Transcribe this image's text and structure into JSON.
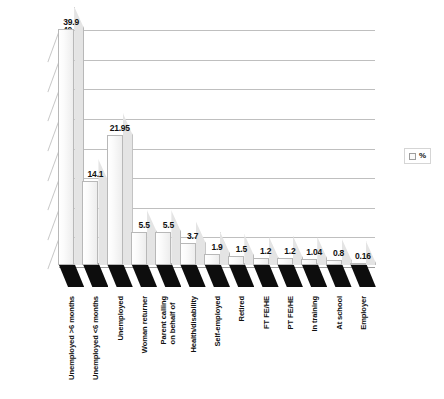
{
  "chart_data": {
    "type": "bar",
    "title": "",
    "subtitle": "",
    "xlabel": "",
    "ylabel": "",
    "ylim": [
      0,
      40
    ],
    "yticks": [
      0,
      5,
      10,
      15,
      20,
      25,
      30,
      35,
      40
    ],
    "grid": true,
    "legend_position": "right",
    "style": "3d-column",
    "categories": [
      "Unemployed >6 months",
      "Unemployed <6 months",
      "Unemployed",
      "Woman returner",
      "Parent calling\non behalf of",
      "Health/disability",
      "Self-employed",
      "Retired",
      "FT FE/HE",
      "PT FE/HE",
      "In training",
      "At school",
      "Employer"
    ],
    "values": [
      39.9,
      14.1,
      21.95,
      5.5,
      5.5,
      3.7,
      1.9,
      1.5,
      1.2,
      1.2,
      1.04,
      0.8,
      0.16
    ],
    "value_labels": [
      "39.9",
      "14.1",
      "21.95",
      "5.5",
      "5.5",
      "3.7",
      "1.9",
      "1.5",
      "1.2",
      "1.2",
      "1.04",
      "0.8",
      "0.16"
    ],
    "series": [
      {
        "name": "%",
        "values": [
          39.9,
          14.1,
          21.95,
          5.5,
          5.5,
          3.7,
          1.9,
          1.5,
          1.2,
          1.2,
          1.04,
          0.8,
          0.16
        ]
      }
    ],
    "legend": [
      "%"
    ],
    "colors": {
      "bar_front": "#fbfbfb",
      "bar_side": "#e4e4e4",
      "bar_base": "#0d0d0d",
      "bar_border": "#b8b8b8",
      "gridline": "#bfbfbf",
      "text": "#111111",
      "background": "#ffffff"
    }
  }
}
